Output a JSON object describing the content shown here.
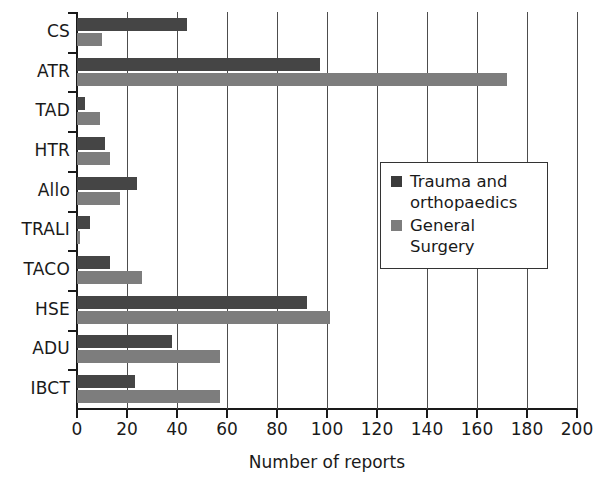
{
  "chart_data": {
    "type": "bar",
    "orientation": "horizontal",
    "title": "",
    "xlabel": "Number of reports",
    "ylabel": "",
    "xlim": [
      0,
      200
    ],
    "xticks": [
      0,
      20,
      40,
      60,
      80,
      100,
      120,
      140,
      160,
      180,
      200
    ],
    "grid": "vertical",
    "legend_position": "middle-right",
    "categories": [
      "CS",
      "ATR",
      "TAD",
      "HTR",
      "Allo",
      "TRALI",
      "TACO",
      "HSE",
      "ADU",
      "IBCT"
    ],
    "series": [
      {
        "name": "Trauma and orthopaedics",
        "color": "#454545",
        "values": [
          44,
          97,
          3,
          11,
          24,
          5,
          13,
          92,
          38,
          23
        ]
      },
      {
        "name": "General Surgery",
        "color": "#7d7d7d",
        "values": [
          10,
          172,
          9,
          13,
          17,
          1,
          26,
          101,
          57,
          57
        ]
      }
    ]
  },
  "legend": {
    "entries": [
      {
        "label": "Trauma and orthopaedics"
      },
      {
        "label": "General Surgery"
      }
    ]
  },
  "axis": {
    "x_title": "Number of reports"
  }
}
